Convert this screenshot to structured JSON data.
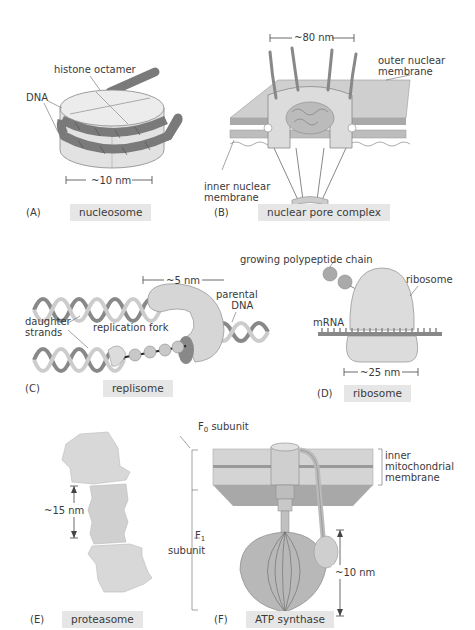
{
  "panels": {
    "A": {
      "letter": "(A)",
      "caption": "nucleosome",
      "labels": {
        "histone": "histone octamer",
        "dna": "DNA",
        "scale": "~10 nm"
      }
    },
    "B": {
      "letter": "(B)",
      "caption": "nuclear pore complex",
      "labels": {
        "scale": "~80 nm",
        "outer_1": "outer nuclear",
        "outer_2": "membrane",
        "inner_1": "inner nuclear",
        "inner_2": "membrane"
      }
    },
    "C": {
      "letter": "(C)",
      "caption": "replisome",
      "labels": {
        "scale": "~5 nm",
        "parental_1": "parental",
        "parental_2": "DNA",
        "daughter_1": "daughter",
        "daughter_2": "strands",
        "fork": "replication fork"
      }
    },
    "D": {
      "letter": "(D)",
      "caption": "ribosome",
      "labels": {
        "chain": "growing polypeptide chain",
        "ribosome": "ribosome",
        "mrna": "mRNA",
        "scale": "~25 nm"
      }
    },
    "E": {
      "letter": "(E)",
      "caption": "proteasome",
      "labels": {
        "scale": "~15 nm"
      }
    },
    "F": {
      "letter": "(F)",
      "caption": "ATP synthase",
      "labels": {
        "f0_main": "F",
        "f0_sub": "0",
        "f0_rest": " subunit",
        "f1_main": "F",
        "f1_sub": "1",
        "f1_rest": "subunit",
        "membrane_1": "inner",
        "membrane_2": "mitochondrial",
        "membrane_3": "membrane",
        "scale": "~10 nm"
      }
    }
  },
  "colors": {
    "caption_bg": "#e6e6e6",
    "protein": "#d0d0d0",
    "dark": "#777777",
    "membrane": "#c8c8c8"
  }
}
